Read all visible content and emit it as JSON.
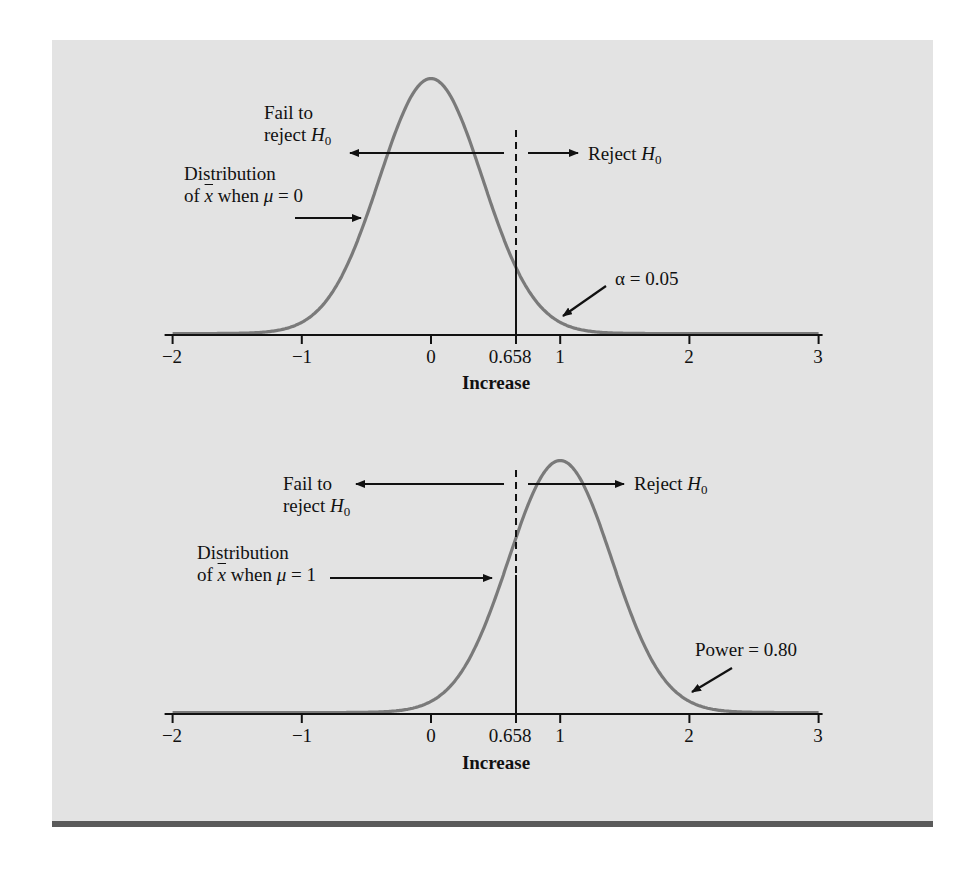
{
  "figure": {
    "panel_color": "#e3e3e3",
    "bar_color": "#5a5a5a",
    "curve_color": "#7a7a7a",
    "ink_color": "#111111"
  },
  "labels": {
    "fail_line1": "Fail to",
    "fail_line2": "reject ",
    "H": "H",
    "zero_sub": "0",
    "reject": "Reject ",
    "dist_line1": "Distribution",
    "dist_of": "of ",
    "xbar": "x",
    "when": " when ",
    "mu": "μ",
    "eq0": " = 0",
    "eq1": " = 1",
    "alpha": "α = 0.05",
    "power": "Power = 0.80",
    "xlabel": "Increase"
  },
  "chart_data": [
    {
      "type": "line",
      "title": "Distribution of x̄ when μ = 0",
      "xlabel": "Increase",
      "ylabel": "",
      "xlim": [
        -2,
        3
      ],
      "x_ticks": [
        -2,
        -1,
        0,
        0.658,
        1,
        2,
        3
      ],
      "x_tick_labels": [
        "−2",
        "−1",
        "0",
        "0.658",
        "1",
        "2",
        "3"
      ],
      "grid": false,
      "series": [
        {
          "name": "Normal(μ=0, σ≈0.4)",
          "mean": 0,
          "sd": 0.4
        }
      ],
      "critical_value": 0.658,
      "annotations": [
        "Fail to reject H0",
        "Reject H0",
        "Distribution of x̄ when μ = 0",
        "α = 0.05"
      ]
    },
    {
      "type": "line",
      "title": "Distribution of x̄ when μ = 1",
      "xlabel": "Increase",
      "ylabel": "",
      "xlim": [
        -2,
        3
      ],
      "x_ticks": [
        -2,
        -1,
        0,
        0.658,
        1,
        2,
        3
      ],
      "x_tick_labels": [
        "−2",
        "−1",
        "0",
        "0.658",
        "1",
        "2",
        "3"
      ],
      "grid": false,
      "series": [
        {
          "name": "Normal(μ=1, σ≈0.4)",
          "mean": 1,
          "sd": 0.4
        }
      ],
      "critical_value": 0.658,
      "annotations": [
        "Fail to reject H0",
        "Reject H0",
        "Distribution of x̄ when μ = 1",
        "Power = 0.80"
      ]
    }
  ],
  "ticks": [
    "−2",
    "−1",
    "0",
    "0.658",
    "1",
    "2",
    "3"
  ]
}
